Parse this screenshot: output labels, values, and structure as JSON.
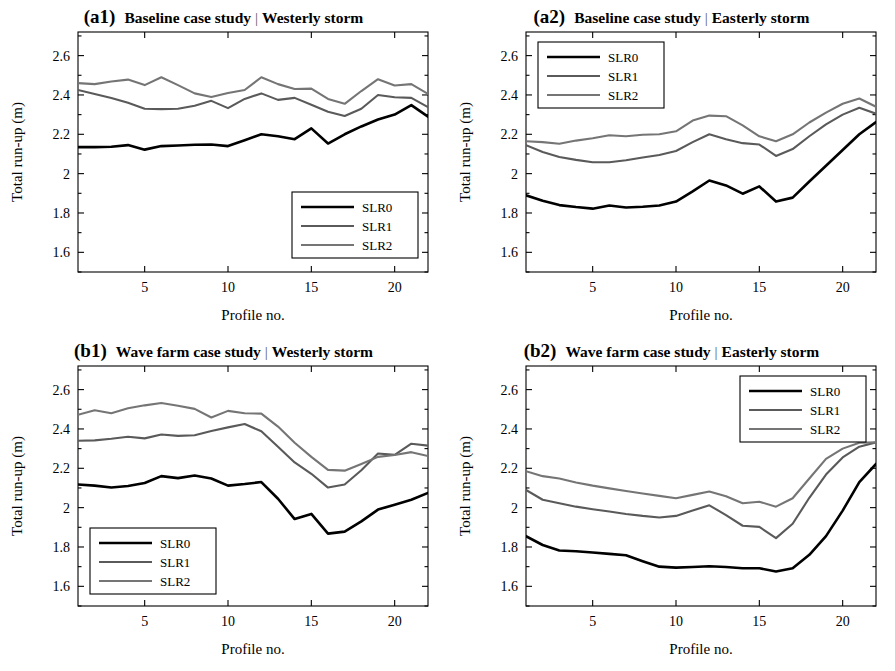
{
  "figure": {
    "ylabel": "Total run-up (m)",
    "xlabel": "Profile no.",
    "yticks": [
      "1.6",
      "1.8",
      "2",
      "2.2",
      "2.4",
      "2.6"
    ],
    "ytickvals": [
      1.6,
      1.8,
      2.0,
      2.2,
      2.4,
      2.6
    ],
    "xticks": [
      "5",
      "10",
      "15",
      "20"
    ],
    "xtickvals": [
      5,
      10,
      15,
      20
    ],
    "colors": {
      "SLR0": "#000000",
      "SLR1": "#5a5a5a",
      "SLR2": "#757575",
      "axis": "#000000",
      "background": "#ffffff"
    },
    "legend_labels": [
      "SLR0",
      "SLR1",
      "SLR2"
    ],
    "separator": "|"
  },
  "panels": [
    {
      "tag": "(a1)",
      "case": "Baseline case study",
      "storm": "Westerly storm",
      "legend_position": "bottom-right"
    },
    {
      "tag": "(a2)",
      "case": "Baseline case study",
      "storm": "Easterly storm",
      "legend_position": "top-left"
    },
    {
      "tag": "(b1)",
      "case": "Wave farm case study",
      "storm": "Westerly storm",
      "legend_position": "bottom-left"
    },
    {
      "tag": "(b2)",
      "case": "Wave farm case study",
      "storm": "Easterly storm",
      "legend_position": "top-right"
    }
  ],
  "chart_data": [
    {
      "id": "a1",
      "type": "line",
      "title": "Baseline case study | Westerly storm",
      "xlabel": "Profile no.",
      "ylabel": "Total run-up (m)",
      "xlim": [
        1,
        22
      ],
      "ylim": [
        1.5,
        2.72
      ],
      "grid": false,
      "legend": "bottom-right",
      "x": [
        1,
        2,
        3,
        4,
        5,
        6,
        7,
        8,
        9,
        10,
        11,
        12,
        13,
        14,
        15,
        16,
        17,
        18,
        19,
        20,
        21,
        22
      ],
      "series": [
        {
          "name": "SLR0",
          "color": "#000000",
          "values": [
            2.135,
            2.135,
            2.137,
            2.145,
            2.122,
            2.14,
            2.143,
            2.147,
            2.148,
            2.14,
            2.17,
            2.2,
            2.19,
            2.175,
            2.23,
            2.153,
            2.2,
            2.24,
            2.275,
            2.3,
            2.348,
            2.29
          ]
        },
        {
          "name": "SLR1",
          "color": "#5a5a5a",
          "values": [
            2.425,
            2.405,
            2.385,
            2.36,
            2.33,
            2.328,
            2.33,
            2.345,
            2.37,
            2.333,
            2.38,
            2.408,
            2.375,
            2.385,
            2.35,
            2.315,
            2.293,
            2.33,
            2.4,
            2.388,
            2.385,
            2.338
          ]
        },
        {
          "name": "SLR2",
          "color": "#757575",
          "values": [
            2.46,
            2.455,
            2.468,
            2.478,
            2.45,
            2.49,
            2.45,
            2.408,
            2.39,
            2.41,
            2.425,
            2.49,
            2.455,
            2.43,
            2.432,
            2.38,
            2.355,
            2.42,
            2.48,
            2.448,
            2.455,
            2.405
          ]
        }
      ]
    },
    {
      "id": "a2",
      "type": "line",
      "title": "Baseline case study | Easterly storm",
      "xlabel": "Profile no.",
      "ylabel": "Total run-up (m)",
      "xlim": [
        1,
        22
      ],
      "ylim": [
        1.5,
        2.72
      ],
      "grid": false,
      "legend": "top-left",
      "x": [
        1,
        2,
        3,
        4,
        5,
        6,
        7,
        8,
        9,
        10,
        11,
        12,
        13,
        14,
        15,
        16,
        17,
        18,
        19,
        20,
        21,
        22
      ],
      "series": [
        {
          "name": "SLR0",
          "color": "#000000",
          "values": [
            1.89,
            1.862,
            1.84,
            1.83,
            1.822,
            1.838,
            1.828,
            1.832,
            1.838,
            1.858,
            1.91,
            1.965,
            1.94,
            1.898,
            1.935,
            1.858,
            1.878,
            1.96,
            2.04,
            2.12,
            2.2,
            2.262
          ]
        },
        {
          "name": "SLR1",
          "color": "#5a5a5a",
          "values": [
            2.145,
            2.11,
            2.085,
            2.07,
            2.058,
            2.058,
            2.068,
            2.082,
            2.095,
            2.115,
            2.16,
            2.2,
            2.175,
            2.155,
            2.148,
            2.09,
            2.125,
            2.19,
            2.25,
            2.3,
            2.335,
            2.305
          ]
        },
        {
          "name": "SLR2",
          "color": "#757575",
          "values": [
            2.165,
            2.16,
            2.152,
            2.168,
            2.18,
            2.195,
            2.19,
            2.198,
            2.2,
            2.215,
            2.27,
            2.295,
            2.292,
            2.245,
            2.19,
            2.165,
            2.2,
            2.26,
            2.31,
            2.355,
            2.382,
            2.34
          ]
        }
      ]
    },
    {
      "id": "b1",
      "type": "line",
      "title": "Wave farm case study | Westerly storm",
      "xlabel": "Profile no.",
      "ylabel": "Total run-up (m)",
      "xlim": [
        1,
        22
      ],
      "ylim": [
        1.5,
        2.72
      ],
      "grid": false,
      "legend": "bottom-left",
      "x": [
        1,
        2,
        3,
        4,
        5,
        6,
        7,
        8,
        9,
        10,
        11,
        12,
        13,
        14,
        15,
        16,
        17,
        18,
        19,
        20,
        21,
        22
      ],
      "series": [
        {
          "name": "SLR0",
          "color": "#000000",
          "values": [
            2.118,
            2.112,
            2.102,
            2.11,
            2.125,
            2.16,
            2.15,
            2.163,
            2.148,
            2.112,
            2.12,
            2.13,
            2.045,
            1.942,
            1.968,
            1.868,
            1.878,
            1.93,
            1.99,
            2.015,
            2.04,
            2.075
          ]
        },
        {
          "name": "SLR1",
          "color": "#5a5a5a",
          "values": [
            2.34,
            2.342,
            2.35,
            2.36,
            2.352,
            2.372,
            2.365,
            2.368,
            2.39,
            2.408,
            2.425,
            2.388,
            2.31,
            2.23,
            2.172,
            2.102,
            2.118,
            2.19,
            2.275,
            2.268,
            2.325,
            2.315
          ]
        },
        {
          "name": "SLR2",
          "color": "#757575",
          "values": [
            2.472,
            2.495,
            2.48,
            2.505,
            2.52,
            2.532,
            2.518,
            2.502,
            2.458,
            2.492,
            2.48,
            2.478,
            2.412,
            2.33,
            2.258,
            2.192,
            2.188,
            2.222,
            2.258,
            2.268,
            2.282,
            2.262
          ]
        }
      ]
    },
    {
      "id": "b2",
      "type": "line",
      "title": "Wave farm case study | Easterly storm",
      "xlabel": "Profile no.",
      "ylabel": "Total run-up (m)",
      "xlim": [
        1,
        22
      ],
      "ylim": [
        1.5,
        2.72
      ],
      "grid": false,
      "legend": "top-right",
      "x": [
        1,
        2,
        3,
        4,
        5,
        6,
        7,
        8,
        9,
        10,
        11,
        12,
        13,
        14,
        15,
        16,
        17,
        18,
        19,
        20,
        21,
        22
      ],
      "series": [
        {
          "name": "SLR0",
          "color": "#000000",
          "values": [
            1.855,
            1.81,
            1.782,
            1.778,
            1.772,
            1.765,
            1.758,
            1.728,
            1.7,
            1.695,
            1.698,
            1.702,
            1.698,
            1.692,
            1.692,
            1.675,
            1.692,
            1.76,
            1.855,
            1.985,
            2.13,
            2.222
          ]
        },
        {
          "name": "SLR1",
          "color": "#5a5a5a",
          "values": [
            2.09,
            2.04,
            2.022,
            2.005,
            1.992,
            1.98,
            1.968,
            1.958,
            1.95,
            1.958,
            1.985,
            2.012,
            1.962,
            1.908,
            1.902,
            1.845,
            1.918,
            2.05,
            2.168,
            2.255,
            2.31,
            2.332
          ]
        },
        {
          "name": "SLR2",
          "color": "#757575",
          "values": [
            2.185,
            2.16,
            2.148,
            2.128,
            2.112,
            2.098,
            2.085,
            2.072,
            2.06,
            2.048,
            2.065,
            2.082,
            2.058,
            2.022,
            2.03,
            2.005,
            2.048,
            2.148,
            2.248,
            2.3,
            2.33,
            2.332
          ]
        }
      ]
    }
  ]
}
